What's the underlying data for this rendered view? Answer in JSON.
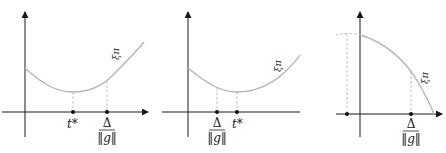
{
  "figure": {
    "panels": [
      {
        "name": "panel-1",
        "curve_label": "ξπ",
        "labels": [
          {
            "id": "tstar",
            "text": "t*"
          },
          {
            "id": "delta_num",
            "text": "Δ"
          },
          {
            "id": "delta_den",
            "text": "‖g‖"
          }
        ],
        "order": "t* < Δ/‖g‖"
      },
      {
        "name": "panel-2",
        "curve_label": "ξπ",
        "labels": [
          {
            "id": "delta_num",
            "text": "Δ"
          },
          {
            "id": "delta_den",
            "text": "‖g‖"
          },
          {
            "id": "tstar",
            "text": "t*"
          }
        ],
        "order": "Δ/‖g‖ < t*"
      },
      {
        "name": "panel-3",
        "curve_label": "ξπ",
        "labels": [
          {
            "id": "delta_num",
            "text": "Δ"
          },
          {
            "id": "delta_den",
            "text": "‖g‖"
          }
        ],
        "order": "concave, decreasing"
      }
    ],
    "colors": {
      "axis": "#1a1a1a",
      "curve": "#b5b5b5",
      "dot": "#111111"
    }
  }
}
